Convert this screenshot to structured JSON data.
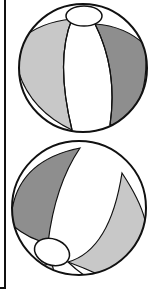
{
  "illustration": {
    "subject": "beach balls",
    "count": 2,
    "colors": {
      "outline": "#111111",
      "white": "#ffffff",
      "light_gray": "#c8c8c8",
      "dark_gray": "#8a8a8a",
      "mid_gray": "#b4b4b4"
    }
  }
}
